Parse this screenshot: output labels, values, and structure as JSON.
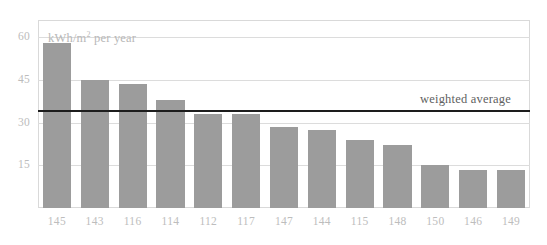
{
  "chart_data": {
    "type": "bar",
    "title": "",
    "subtitle": "",
    "unit_label": "kWh/m² per year",
    "unit_label_base": "kWh/m",
    "unit_label_sup": "2",
    "unit_label_tail": " per year",
    "xlabel": "",
    "ylabel": "",
    "categories": [
      "145",
      "143",
      "116",
      "114",
      "112",
      "117",
      "147",
      "144",
      "115",
      "148",
      "150",
      "146",
      "149"
    ],
    "values": [
      58,
      45,
      43.5,
      38,
      33,
      33,
      28.5,
      27.5,
      24,
      22,
      15,
      13.5,
      13.5
    ],
    "ylim": [
      0,
      66
    ],
    "yticks": [
      60,
      45,
      30,
      15
    ],
    "ytick_labels": [
      "60",
      "45",
      "30",
      "15"
    ],
    "grid": true,
    "legend": "none",
    "bar_color": "#9c9c9c",
    "gridline_color": "#dcdcdc",
    "frame_color": "#d9d9d9",
    "tick_label_color": "#bdbdbd",
    "annotations": [
      {
        "name": "weighted-average",
        "label": "weighted average",
        "value": 34,
        "type": "hline",
        "color": "#1d1d1d"
      }
    ]
  }
}
